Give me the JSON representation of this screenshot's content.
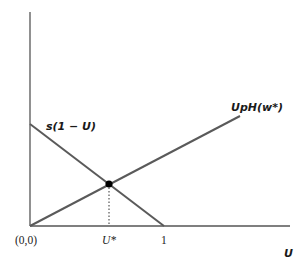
{
  "diagram": {
    "type": "line-intersection",
    "axes": {
      "x_label": "U",
      "y_label": "",
      "origin_label": "(0,0)",
      "x_tick_labels": [
        "U*",
        "1"
      ]
    },
    "lines": [
      {
        "name": "s(1 - U)",
        "label": "s(1 − U)",
        "direction": "decreasing",
        "from": [
          0,
          "s"
        ],
        "to": [
          1,
          0
        ]
      },
      {
        "name": "UpH(w*)",
        "label": "UpH(w*)",
        "direction": "increasing",
        "from": [
          0,
          0
        ]
      }
    ],
    "equilibrium": {
      "label": "U*",
      "marker": "filled-dot",
      "dropline": "dotted"
    },
    "colors": {
      "axis": "#555555",
      "line": "#5a5a5a",
      "dot": "#000000"
    }
  }
}
